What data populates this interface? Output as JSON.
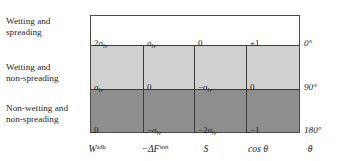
{
  "figure": {
    "type": "wetting-regime-nomogram",
    "regions": [
      {
        "name": "wetting-and-spreading",
        "line1": "Wetting and",
        "line2": "spreading"
      },
      {
        "name": "wetting-and-non-spreading",
        "line1": "Wetting and",
        "line2": "non-spreading"
      },
      {
        "name": "non-wetting-and-non-spreading",
        "line1": "Non-wetting and",
        "line2": "non-spreading"
      }
    ],
    "axes": [
      {
        "id": "w-adh",
        "label_main": "W",
        "label_sup": "adh"
      },
      {
        "id": "df-wet",
        "label_main": "−ΔF",
        "label_sup": "wet"
      },
      {
        "id": "s",
        "label_main": "S",
        "label_sup": ""
      },
      {
        "id": "cos-theta",
        "label_main": "cos θ",
        "label_sup": ""
      },
      {
        "id": "theta",
        "label_main": "θ",
        "label_sup": ""
      }
    ],
    "angle_ticks": [
      {
        "id": "angle-0",
        "value": "0°"
      },
      {
        "id": "angle-90",
        "value": "90°"
      },
      {
        "id": "angle-180",
        "value": "180°"
      }
    ],
    "rows": [
      {
        "id": "row-0deg",
        "angle": "0°",
        "values": [
          {
            "pre": "2",
            "sym": "σ",
            "sub": "lv"
          },
          {
            "pre": "",
            "sym": "σ",
            "sub": "lv"
          },
          {
            "pre": "0",
            "sym": "",
            "sub": ""
          },
          {
            "pre": "+1",
            "sym": "",
            "sub": ""
          }
        ]
      },
      {
        "id": "row-90deg",
        "angle": "90°",
        "values": [
          {
            "pre": "",
            "sym": "σ",
            "sub": "lv"
          },
          {
            "pre": "0",
            "sym": "",
            "sub": ""
          },
          {
            "pre": "−",
            "sym": "σ",
            "sub": "lv"
          },
          {
            "pre": "0",
            "sym": "",
            "sub": ""
          }
        ]
      },
      {
        "id": "row-180deg",
        "angle": "180°",
        "values": [
          {
            "pre": "0",
            "sym": "",
            "sub": ""
          },
          {
            "pre": "−",
            "sym": "σ",
            "sub": "lv"
          },
          {
            "pre": "−2",
            "sym": "σ",
            "sub": "lv"
          },
          {
            "pre": "−1",
            "sym": "",
            "sub": ""
          }
        ]
      }
    ],
    "colors": {
      "band_top": "#ffffff",
      "band_middle": "#d0d0d0",
      "band_bottom": "#8e8e8e",
      "rule": "#3a3a3a",
      "text": "#1a1a1a"
    }
  }
}
